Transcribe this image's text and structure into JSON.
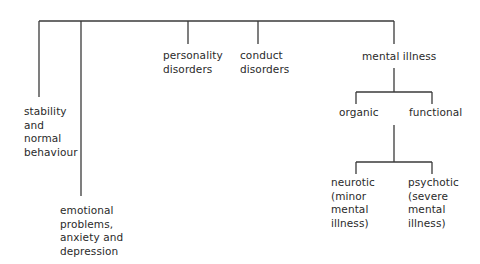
{
  "diagram": {
    "type": "tree",
    "line_color": "#3a3a3a",
    "nodes": {
      "stability": "stability\nand\nnormal\nbehaviour",
      "emotional": "emotional\nproblems,\nanxiety and\ndepression",
      "personality": "personality\ndisorders",
      "conduct": "conduct\ndisorders",
      "mental_illness": "mental illness",
      "organic": "organic",
      "functional": "functional",
      "neurotic": "neurotic\n(minor\nmental\nillness)",
      "psychotic": "psychotic\n(severe\nmental\nillness)"
    },
    "edges": [
      [
        "root",
        "stability"
      ],
      [
        "root",
        "emotional"
      ],
      [
        "root",
        "personality"
      ],
      [
        "root",
        "conduct"
      ],
      [
        "root",
        "mental_illness"
      ],
      [
        "mental_illness",
        "organic"
      ],
      [
        "mental_illness",
        "functional"
      ],
      [
        "functional",
        "neurotic"
      ],
      [
        "functional",
        "psychotic"
      ]
    ]
  }
}
